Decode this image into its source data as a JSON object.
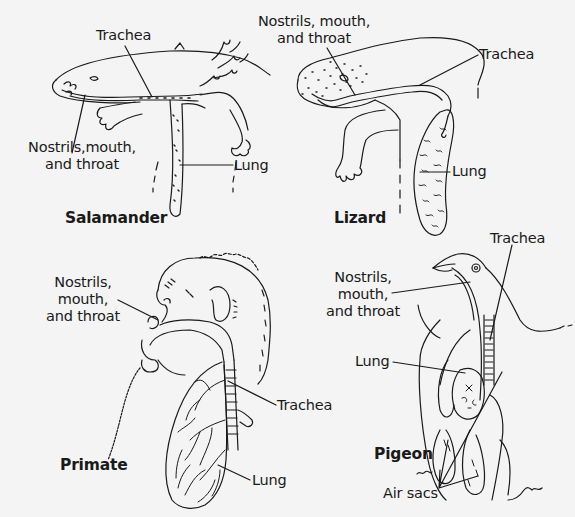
{
  "figure": {
    "panels": [
      {
        "id": "salamander",
        "title": "Salamander",
        "labels": {
          "trachea": "Trachea",
          "nostrils_line1": "Nostrils,mouth,",
          "nostrils_line2": "and throat",
          "lung": "Lung"
        }
      },
      {
        "id": "lizard",
        "title": "Lizard",
        "labels": {
          "nostrils_line1": "Nostrils, mouth,",
          "nostrils_line2": "and throat",
          "trachea": "Trachea",
          "lung": "Lung"
        }
      },
      {
        "id": "primate",
        "title": "Primate",
        "labels": {
          "nostrils_line1": "Nostrils,",
          "nostrils_line2": "mouth,",
          "nostrils_line3": "and throat",
          "trachea": "Trachea",
          "lung": "Lung"
        }
      },
      {
        "id": "pigeon",
        "title": "Pigeon",
        "labels": {
          "trachea": "Trachea",
          "nostrils_line1": "Nostrils,",
          "nostrils_line2": "mouth,",
          "nostrils_line3": "and throat",
          "lung": "Lung",
          "air_sacs": "Air sacs"
        }
      }
    ],
    "colors": {
      "background": "#f4f4f4",
      "ink": "#1a1a1a"
    }
  }
}
